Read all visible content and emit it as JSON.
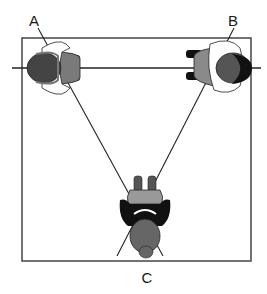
{
  "diagram": {
    "type": "top-down seating/camera position diagram",
    "labels": {
      "a": "A",
      "b": "B",
      "c": "C"
    },
    "figures": [
      {
        "id": "person-a",
        "position": "top-left corner",
        "facing": "right"
      },
      {
        "id": "person-b",
        "position": "top-right corner",
        "facing": "left"
      },
      {
        "id": "person-c",
        "position": "bottom-center",
        "facing": "up"
      }
    ],
    "colors": {
      "line": "#333333",
      "hair_dark": "#111111",
      "hair_gray": "#555555",
      "clothing_gray": "#8a8a8a",
      "background": "#ffffff"
    }
  }
}
